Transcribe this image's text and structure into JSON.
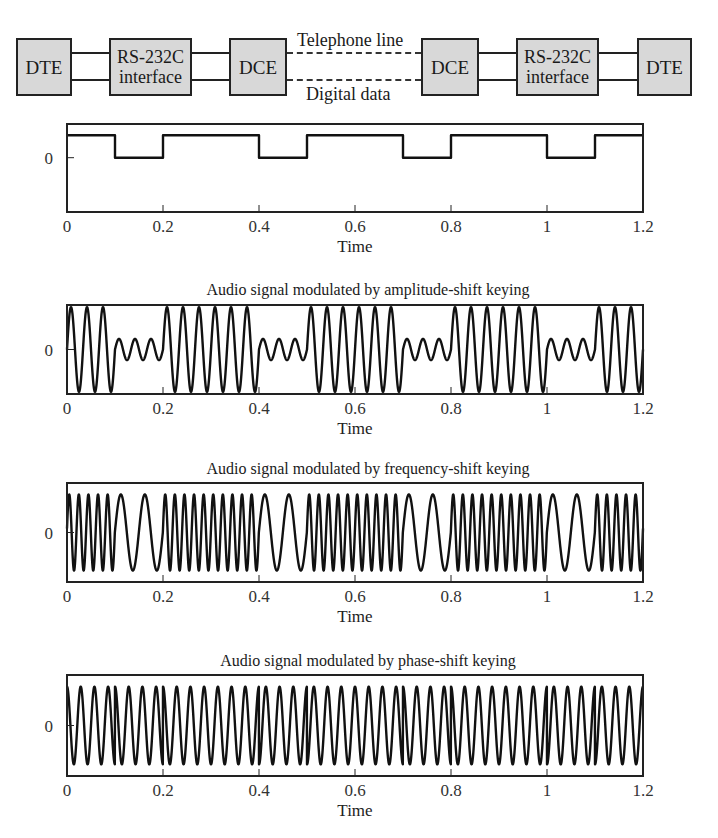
{
  "diagram": {
    "blocks": [
      {
        "id": "dte-left",
        "label": "DTE"
      },
      {
        "id": "rs232-left",
        "label_line1": "RS-232C",
        "label_line2": "interface"
      },
      {
        "id": "dce-left",
        "label": "DCE"
      },
      {
        "id": "dce-right",
        "label": "DCE"
      },
      {
        "id": "rs232-right",
        "label_line1": "RS-232C",
        "label_line2": "interface"
      },
      {
        "id": "dte-right",
        "label": "DTE"
      }
    ],
    "telephone_line_label": "Telephone line",
    "digital_data_label": "Digital data"
  },
  "chart_data": [
    {
      "type": "line",
      "id": "digital",
      "title": "",
      "xlabel": "Time",
      "ylabel": "",
      "xlim": [
        0,
        1.2
      ],
      "ylim": [
        -1.45,
        0.9
      ],
      "xticks": [
        0,
        0.2,
        0.4,
        0.6,
        0.8,
        1,
        1.2
      ],
      "xtick_labels": [
        "0",
        "0.2",
        "0.4",
        "0.6",
        "0.8",
        "1",
        "1.2"
      ],
      "yticks": [
        0
      ],
      "ytick_labels": [
        "0"
      ],
      "signal": "square",
      "bit_period": 0.1,
      "bits": [
        1,
        0,
        1,
        1,
        0,
        1,
        1,
        0,
        1,
        1,
        0,
        1
      ],
      "levels": {
        "high": 0.6,
        "low": 0
      }
    },
    {
      "type": "line",
      "id": "ask",
      "title": "Audio signal modulated by amplitude-shift keying",
      "xlabel": "Time",
      "ylabel": "",
      "xlim": [
        0,
        1.2
      ],
      "ylim": [
        -1.05,
        1.05
      ],
      "xticks": [
        0,
        0.2,
        0.4,
        0.6,
        0.8,
        1,
        1.2
      ],
      "xtick_labels": [
        "0",
        "0.2",
        "0.4",
        "0.6",
        "0.8",
        "1",
        "1.2"
      ],
      "yticks": [
        0
      ],
      "ytick_labels": [
        "0"
      ],
      "signal": "ask",
      "bit_period": 0.1,
      "bits": [
        1,
        0,
        1,
        1,
        0,
        1,
        1,
        0,
        1,
        1,
        0,
        1
      ],
      "carrier_hz": 30,
      "amplitude_high": 1.0,
      "amplitude_low": 0.25
    },
    {
      "type": "line",
      "id": "fsk",
      "title": "Audio signal modulated by frequency-shift keying",
      "xlabel": "Time",
      "ylabel": "",
      "xlim": [
        0,
        1.2
      ],
      "ylim": [
        -1.3,
        1.3
      ],
      "xticks": [
        0,
        0.2,
        0.4,
        0.6,
        0.8,
        1,
        1.2
      ],
      "xtick_labels": [
        "0",
        "0.2",
        "0.4",
        "0.6",
        "0.8",
        "1",
        "1.2"
      ],
      "yticks": [
        0
      ],
      "ytick_labels": [
        "0"
      ],
      "signal": "fsk",
      "bit_period": 0.1,
      "bits": [
        1,
        0,
        1,
        1,
        0,
        1,
        1,
        0,
        1,
        1,
        0,
        1
      ],
      "freq_high_hz": 50,
      "freq_low_hz": 20,
      "amplitude": 1.0
    },
    {
      "type": "line",
      "id": "psk",
      "title": "Audio signal modulated by phase-shift keying",
      "xlabel": "Time",
      "ylabel": "",
      "xlim": [
        0,
        1.2
      ],
      "ylim": [
        -1.3,
        1.3
      ],
      "xticks": [
        0,
        0.2,
        0.4,
        0.6,
        0.8,
        1,
        1.2
      ],
      "xtick_labels": [
        "0",
        "0.2",
        "0.4",
        "0.6",
        "0.8",
        "1",
        "1.2"
      ],
      "yticks": [
        0
      ],
      "ytick_labels": [
        "0"
      ],
      "signal": "psk",
      "bit_period": 0.1,
      "bits": [
        1,
        0,
        1,
        1,
        0,
        1,
        1,
        0,
        1,
        1,
        0,
        1
      ],
      "carrier_hz": 35,
      "amplitude": 1.0
    }
  ],
  "colors": {
    "line": "#111111",
    "frame": "#222222",
    "block_fill": "#d8d8d8"
  }
}
